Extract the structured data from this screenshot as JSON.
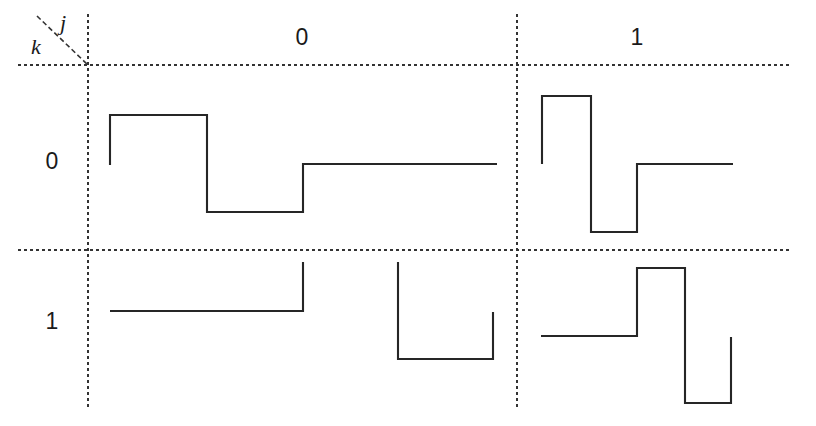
{
  "figure": {
    "type": "waveform-truth-table",
    "background_color": "#ffffff",
    "line_color": "#262626",
    "grid_color": "#333333",
    "width": 816,
    "height": 426
  },
  "header": {
    "corner": {
      "column_variable": "j",
      "row_variable": "k",
      "diagonal": {
        "x1": 37,
        "y1": 16,
        "x2": 88,
        "y2": 65
      },
      "j_label_pos": {
        "x": 62,
        "y": 14
      },
      "k_label_pos": {
        "x": 33,
        "y": 38
      }
    },
    "column_labels": [
      {
        "text": "0",
        "x": 302,
        "y": 28
      },
      {
        "text": "1",
        "x": 637,
        "y": 28
      }
    ],
    "row_labels": [
      {
        "text": "0",
        "x": 52,
        "y": 152
      },
      {
        "text": "1",
        "x": 52,
        "y": 312
      }
    ]
  },
  "grid": {
    "vertical_lines": [
      {
        "name": "row-label-divider",
        "x": 88,
        "y1": 14,
        "y2": 410
      },
      {
        "name": "column-divider",
        "x": 517,
        "y1": 14,
        "y2": 410
      }
    ],
    "horizontal_lines": [
      {
        "name": "header-divider",
        "y": 65,
        "x1": 18,
        "x2": 790
      },
      {
        "name": "row-divider",
        "y": 250,
        "x1": 18,
        "x2": 790
      }
    ],
    "dash_pattern": "3 3",
    "dash_width": 2
  },
  "chart_data": {
    "type": "line",
    "title": "",
    "xlabel": "j",
    "ylabel": "k",
    "cells": [
      {
        "name": "cell-k0-j0",
        "row": "0",
        "col": "0",
        "polyline": "110,165 110,115 207,115 207,212 303,212 303,164 497,164"
      },
      {
        "name": "cell-k0-j1",
        "row": "0",
        "col": "1",
        "polyline": "542,164 542,96 591,96 591,232 637,232 637,164 733,164"
      },
      {
        "name": "cell-k1-j0",
        "row": "1",
        "col": "0",
        "polyline_segments": [
          "110,311 303,311 303,262",
          "398,262 398,359 493,359 493,312"
        ]
      },
      {
        "name": "cell-k1-j1",
        "row": "1",
        "col": "1",
        "polyline": "541,336 637,336 637,268 685,268 685,403 731,403 731,337"
      }
    ]
  }
}
